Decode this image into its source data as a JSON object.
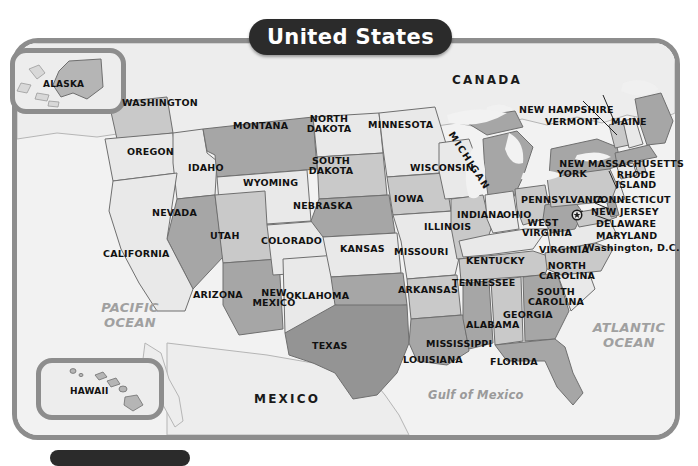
{
  "title": "United States",
  "insets": [
    {
      "name": "alaska",
      "label": "ALASKA"
    },
    {
      "name": "hawaii",
      "label": "HAWAII"
    }
  ],
  "countries": [
    {
      "label": "CANADA"
    },
    {
      "label": "MEXICO"
    }
  ],
  "water": [
    {
      "label_line1": "PACIFIC",
      "label_line2": "OCEAN"
    },
    {
      "label_line1": "ATLANTIC",
      "label_line2": "OCEAN"
    },
    {
      "label": "Gulf of Mexico"
    }
  ],
  "capital": {
    "label": "Washington, D.C.",
    "marker": "star-in-circle"
  },
  "states": [
    {
      "label": "WASHINGTON"
    },
    {
      "label": "OREGON"
    },
    {
      "label": "IDAHO"
    },
    {
      "label": "MONTANA"
    },
    {
      "label": "WYOMING"
    },
    {
      "label": "NEVADA"
    },
    {
      "label": "UTAH"
    },
    {
      "label": "CALIFORNIA"
    },
    {
      "label": "ARIZONA"
    },
    {
      "label": "COLORADO"
    },
    {
      "label": "NEW\nMEXICO"
    },
    {
      "label": "NORTH\nDAKOTA"
    },
    {
      "label": "SOUTH\nDAKOTA"
    },
    {
      "label": "NEBRASKA"
    },
    {
      "label": "KANSAS"
    },
    {
      "label": "OKLAHOMA"
    },
    {
      "label": "TEXAS"
    },
    {
      "label": "MINNESOTA"
    },
    {
      "label": "IOWA"
    },
    {
      "label": "MISSOURI"
    },
    {
      "label": "ARKANSAS"
    },
    {
      "label": "LOUISIANA"
    },
    {
      "label": "WISCONSIN"
    },
    {
      "label": "ILLINOIS"
    },
    {
      "label": "MICHIGAN"
    },
    {
      "label": "INDIANA"
    },
    {
      "label": "OHIO"
    },
    {
      "label": "KENTUCKY"
    },
    {
      "label": "TENNESSEE"
    },
    {
      "label": "MISSISSIPPI"
    },
    {
      "label": "ALABAMA"
    },
    {
      "label": "GEORGIA"
    },
    {
      "label": "FLORIDA"
    },
    {
      "label": "SOUTH\nCAROLINA"
    },
    {
      "label": "NORTH\nCAROLINA"
    },
    {
      "label": "VIRGINIA"
    },
    {
      "label": "WEST\nVIRGINIA"
    },
    {
      "label": "MARYLAND"
    },
    {
      "label": "DELAWARE"
    },
    {
      "label": "NEW JERSEY"
    },
    {
      "label": "PENNSYLVANIA"
    },
    {
      "label": "NEW\nYORK"
    },
    {
      "label": "CONNECTICUT"
    },
    {
      "label": "RHODE\nISLAND"
    },
    {
      "label": "MASSACHUSETTS"
    },
    {
      "label": "VERMONT"
    },
    {
      "label": "NEW HAMPSHIRE"
    },
    {
      "label": "MAINE"
    }
  ],
  "label_text": {
    "washington": "WASHINGTON",
    "oregon": "OREGON",
    "idaho": "IDAHO",
    "montana": "MONTANA",
    "wyoming": "WYOMING",
    "nevada": "NEVADA",
    "utah": "UTAH",
    "california": "CALIFORNIA",
    "arizona": "ARIZONA",
    "colorado": "COLORADO",
    "new_mexico_1": "NEW",
    "new_mexico_2": "MEXICO",
    "north_dakota_1": "NORTH",
    "north_dakota_2": "DAKOTA",
    "south_dakota_1": "SOUTH",
    "south_dakota_2": "DAKOTA",
    "nebraska": "NEBRASKA",
    "kansas": "KANSAS",
    "oklahoma": "OKLAHOMA",
    "texas": "TEXAS",
    "minnesota": "MINNESOTA",
    "iowa": "IOWA",
    "missouri": "MISSOURI",
    "arkansas": "ARKANSAS",
    "louisiana": "LOUISIANA",
    "wisconsin": "WISCONSIN",
    "illinois": "ILLINOIS",
    "michigan": "MICHIGAN",
    "indiana": "INDIANA",
    "ohio": "OHIO",
    "kentucky": "KENTUCKY",
    "tennessee": "TENNESSEE",
    "mississippi": "MISSISSIPPI",
    "alabama": "ALABAMA",
    "georgia": "GEORGIA",
    "florida": "FLORIDA",
    "south_carolina_1": "SOUTH",
    "south_carolina_2": "CAROLINA",
    "north_carolina_1": "NORTH",
    "north_carolina_2": "CAROLINA",
    "virginia": "VIRGINIA",
    "west_virginia_1": "WEST",
    "west_virginia_2": "VIRGINIA",
    "maryland": "MARYLAND",
    "delaware": "DELAWARE",
    "new_jersey": "NEW JERSEY",
    "pennsylvania": "PENNSYLVANIA",
    "new_york_1": "NEW",
    "new_york_2": "YORK",
    "connecticut": "CONNECTICUT",
    "rhode_island_1": "RHODE",
    "rhode_island_2": "ISLAND",
    "massachusetts": "MASSACHUSETTS",
    "vermont": "VERMONT",
    "new_hampshire": "NEW HAMPSHIRE",
    "maine": "MAINE",
    "canada": "CANADA",
    "mexico": "MEXICO",
    "pacific_1": "PACIFIC",
    "pacific_2": "OCEAN",
    "atlantic_1": "ATLANTIC",
    "atlantic_2": "OCEAN",
    "gulf": "Gulf of Mexico",
    "dc": "Washington, D.C.",
    "alaska": "ALASKA",
    "hawaii": "HAWAII"
  },
  "colors": {
    "title_pill": "#2b2b2b",
    "title_text": "#ffffff",
    "frame": "#8d8d8d",
    "ocean_bg": "#f2f2f2",
    "ocean_text": "#a0a0a0",
    "state_light": "#e9e9e9",
    "state_mid": "#c9c9c9",
    "state_dark": "#a6a6a6",
    "state_darker": "#8f8f8f",
    "neighbor": "#ededed",
    "border": "#6f6f6f"
  }
}
